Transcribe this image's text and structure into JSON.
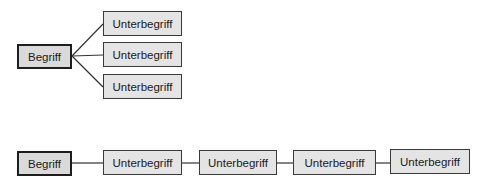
{
  "diagram_top": {
    "root": {
      "label": "Begriff"
    },
    "children": [
      {
        "label": "Unterbegriff"
      },
      {
        "label": "Unterbegriff"
      },
      {
        "label": "Unterbegriff"
      }
    ]
  },
  "diagram_bottom": {
    "root": {
      "label": "Begriff"
    },
    "chain": [
      {
        "label": "Unterbegriff"
      },
      {
        "label": "Unterbegriff"
      },
      {
        "label": "Unterbegriff"
      },
      {
        "label": "Unterbegriff"
      }
    ]
  }
}
